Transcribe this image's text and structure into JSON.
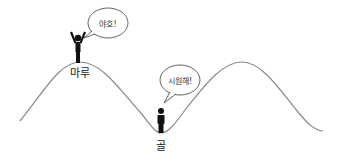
{
  "diagram": {
    "type": "wave-crest-trough-illustration",
    "colors": {
      "curve": "#8a8a8a",
      "figure": "#111111",
      "bubble_stroke": "#555555",
      "background": "#ffffff"
    },
    "crest": {
      "label": "마루",
      "speech": "야호!",
      "figure_pose": "arms-raised"
    },
    "trough": {
      "label": "골",
      "speech": "시원해!",
      "figure_pose": "standing"
    }
  }
}
